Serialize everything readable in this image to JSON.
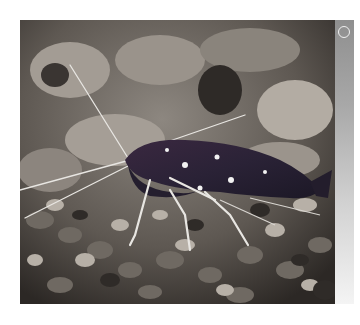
{
  "image": {
    "alt": "Dark blue-maroon shrimp with white-spotted body and white legs and antennae on aquarium gravel",
    "subject": "shrimp",
    "background": "gravel substrate"
  },
  "side_strip": {
    "icon": "circle-icon"
  },
  "colors": {
    "shrimp_body": "#2a2236",
    "shrimp_spots": "#f2f2f2",
    "legs_antennae": "#e8e6e2",
    "gravel_light": "#a9a29a",
    "gravel_dark": "#3a3532",
    "strip_top": "#8f8f8f",
    "strip_bottom": "#f4f4f4"
  }
}
